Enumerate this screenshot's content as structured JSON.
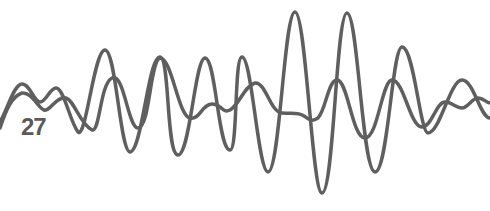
{
  "illustration": {
    "label": "27",
    "stroke_color": "#5f5f5f",
    "label_color": "#5a5a5a",
    "background": "#ffffff",
    "waves": [
      {
        "name": "wave-high-amplitude",
        "path": "M 0 122 C 8 108 14 84 22 84 C 30 84 34 102 40 102 C 46 102 50 88 56 88 C 64 88 70 122 78 132 C 86 140 94 50 105 50 C 116 50 120 152 130 152 C 142 152 148 57 160 57 C 170 57 166 155 178 155 C 190 155 195 58 205 58 C 216 58 218 150 230 150 C 238 150 234 57 242 57 C 252 57 258 172 268 172 C 280 172 284 12 295 12 C 306 12 312 193 322 193 C 334 193 336 13 347 13 C 358 13 362 172 375 172 C 388 172 392 47 402 47 C 414 47 420 133 428 133 C 440 133 450 80 462 80 C 474 80 480 118 490 118"
      },
      {
        "name": "wave-low-amplitude",
        "path": "M 0 128 C 6 110 12 96 22 93 C 32 92 38 108 44 110 C 50 112 56 96 66 98 C 74 100 80 124 92 130 C 100 132 100 84 112 78 C 124 72 128 128 138 128 C 150 128 150 60 160 58 C 172 58 178 116 190 118 C 200 120 202 104 212 104 C 222 104 222 114 230 110 C 240 104 244 86 255 83 C 266 82 270 112 282 113 C 292 114 298 112 304 116 C 310 120 312 122 318 118 C 326 110 328 80 337 80 C 348 80 352 138 365 138 C 378 138 382 80 392 80 C 404 80 410 127 422 127 C 432 127 436 102 445 102 C 452 102 456 108 462 108 C 468 108 472 98 478 98 C 484 98 486 103 490 103"
      }
    ]
  }
}
